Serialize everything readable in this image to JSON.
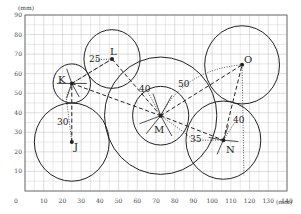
{
  "axes": {
    "y_unit": "(mm)",
    "x_unit": "(mm)",
    "origin_label": "0",
    "x_ticks": [
      "10",
      "20",
      "30",
      "40",
      "50",
      "60",
      "70",
      "80",
      "90",
      "100",
      "110",
      "120",
      "130",
      "140"
    ],
    "y_ticks": [
      "10",
      "20",
      "30",
      "40",
      "50",
      "60",
      "70",
      "80",
      "90"
    ],
    "x_range": [
      0,
      140
    ],
    "y_range": [
      0,
      90
    ],
    "grid_minor_mm": 5
  },
  "points": [
    {
      "id": "K",
      "x": 25,
      "y": 55,
      "circle_r": 10
    },
    {
      "id": "J",
      "x": 25,
      "y": 25,
      "circle_r": 20
    },
    {
      "id": "L",
      "x": 46.5,
      "y": 67.5,
      "circle_r": 15
    },
    {
      "id": "M",
      "x": 72.5,
      "y": 38.5,
      "circle_r": 15,
      "outer_circle_r": 30
    },
    {
      "id": "N",
      "x": 106,
      "y": 26,
      "circle_r": 20
    },
    {
      "id": "O",
      "x": 116,
      "y": 64.5,
      "circle_r": 20
    }
  ],
  "labels": {
    "K": "K",
    "J": "J",
    "L": "L",
    "M": "M",
    "N": "N",
    "O": "O"
  },
  "dimensions": {
    "d30": "30",
    "d25": "25",
    "d40_top": "40",
    "d50": "50",
    "d35": "35",
    "d40_right": "40"
  },
  "colors": {
    "grid": "#c8c8c8",
    "axis": "#555555",
    "stroke": "#222222"
  }
}
